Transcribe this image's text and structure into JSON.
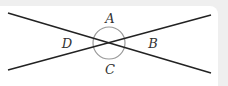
{
  "diagram": {
    "labels": {
      "A": "A",
      "B": "B",
      "C": "C",
      "D": "D"
    },
    "colors": {
      "background": "#efefef",
      "panel": "#ffffff",
      "lines": "#222222",
      "arc": "#999999",
      "text": "#333333"
    }
  }
}
